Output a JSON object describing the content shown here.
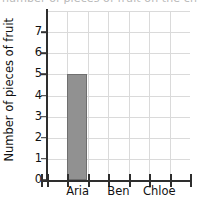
{
  "cutoff_text": "number of pieces of fruit on the chart below",
  "chart_data": {
    "type": "bar",
    "title": "",
    "xlabel": "",
    "ylabel": "Number of pieces of fruit",
    "categories": [
      "Aria",
      "Ben",
      "Chloe"
    ],
    "values": [
      5,
      0,
      0
    ],
    "ylim": [
      0,
      8
    ],
    "ytick_labels": [
      "0",
      "1",
      "2",
      "3",
      "4",
      "5",
      "6",
      "7"
    ],
    "ytick_values": [
      0,
      1,
      2,
      3,
      4,
      5,
      6,
      7
    ],
    "grid": true,
    "legend": "none",
    "bar_color": "#919191",
    "bar_edge_color": "#6f6f6f",
    "grid_color": "#dadada",
    "axis_color": "#2e2e2e"
  }
}
